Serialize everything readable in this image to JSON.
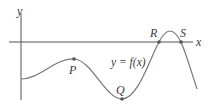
{
  "diagram": {
    "axes": {
      "x_label": "x",
      "y_label": "y"
    },
    "curve_label": "y = f(x)",
    "points": [
      {
        "name": "P",
        "description": "local maximum below x-axis"
      },
      {
        "name": "Q",
        "description": "local minimum"
      },
      {
        "name": "R",
        "description": "x-intercept (rising)"
      },
      {
        "name": "S",
        "description": "x-intercept (falling)"
      }
    ],
    "colors": {
      "axis": "#555555",
      "curve": "#777777",
      "point": "#555555",
      "text": "#3a3a3a"
    }
  }
}
